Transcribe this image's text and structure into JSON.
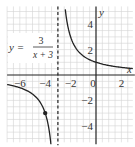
{
  "chart_data": {
    "type": "line",
    "title": "",
    "equation": {
      "lhs": "y =",
      "numerator": "3",
      "denominator": "x + 3"
    },
    "xlabel": "x",
    "ylabel": "y",
    "xlim": [
      -7,
      2.9
    ],
    "ylim": [
      -5.3,
      5.4
    ],
    "grid": true,
    "x_ticks": [
      "-6",
      "-4",
      "-2",
      "0",
      "2"
    ],
    "y_ticks": [
      "4",
      "2",
      "-2",
      "-4"
    ],
    "asymptote": {
      "type": "vertical",
      "x": -3,
      "style": "dashed"
    },
    "series": [
      {
        "name": "y = 3/(x+3)",
        "function": "3/(x+3)",
        "branches": [
          [
            -7,
            -3.55
          ],
          [
            -2.42,
            2.9
          ]
        ]
      }
    ],
    "points": [
      {
        "x": -4,
        "y": -3
      }
    ]
  },
  "colors": {
    "grid": "#d4d4d4",
    "axis": "#222222",
    "curve": "#222222"
  }
}
